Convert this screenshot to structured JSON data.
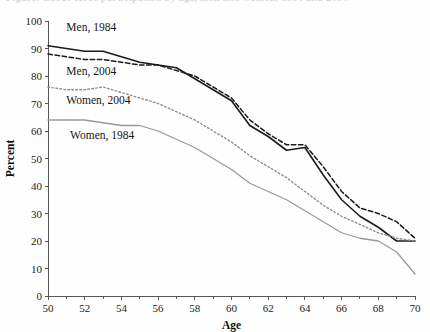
{
  "figure": {
    "cropped_title_fragment": "Figure: Labor force participation by age, men and women, 1984 and 2004",
    "background_color": "#fefefe"
  },
  "chart_data": {
    "type": "line",
    "title": "",
    "xlabel": "Age",
    "ylabel": "Percent",
    "xlim": [
      50,
      70
    ],
    "ylim": [
      0,
      100
    ],
    "xticks": [
      50,
      52,
      54,
      56,
      58,
      60,
      62,
      64,
      66,
      68,
      70
    ],
    "xtick_labels": [
      "50",
      "52",
      "54",
      "56",
      "58",
      "60",
      "62",
      "64",
      "66",
      "68",
      "70"
    ],
    "xminor_ticks": [
      51,
      53,
      55,
      57,
      59,
      61,
      63,
      65,
      67,
      69
    ],
    "yticks": [
      0,
      10,
      20,
      30,
      40,
      50,
      60,
      70,
      80,
      90,
      100
    ],
    "ytick_labels": [
      "0",
      "10",
      "20",
      "30",
      "40",
      "50",
      "60",
      "70",
      "80",
      "90",
      "100"
    ],
    "grid": false,
    "legend_position": "inline-labels",
    "x": [
      50,
      51,
      52,
      53,
      54,
      55,
      56,
      57,
      58,
      59,
      60,
      61,
      62,
      63,
      64,
      65,
      66,
      67,
      68,
      69,
      70
    ],
    "series": [
      {
        "name": "Men, 1984",
        "color": "#1b1b1b",
        "style": "solid",
        "width": 1.6,
        "label_x": 51.0,
        "label_y": 96.5,
        "values": [
          91,
          90,
          89,
          89,
          87,
          85,
          84,
          83,
          79,
          75,
          71,
          62,
          58,
          53,
          54,
          44,
          35,
          29,
          25,
          20,
          20
        ]
      },
      {
        "name": "Men, 2004",
        "color": "#1b1b1b",
        "style": "dashed",
        "width": 1.5,
        "label_x": 51.0,
        "label_y": 80.5,
        "values": [
          88,
          87,
          86,
          86,
          85,
          84,
          84,
          82,
          80,
          76,
          72,
          64,
          59,
          55,
          55,
          47,
          38,
          32,
          30,
          27,
          21
        ]
      },
      {
        "name": "Women, 2004",
        "color": "#8d8d8d",
        "style": "dotted",
        "width": 1.4,
        "label_x": 51.0,
        "label_y": 70.0,
        "values": [
          76,
          75,
          75,
          76,
          74,
          72,
          70,
          67,
          64,
          60,
          56,
          51,
          47,
          43,
          38,
          33,
          29,
          26,
          23,
          21,
          20
        ]
      },
      {
        "name": "Women, 1984",
        "color": "#9a9a9a",
        "style": "solid",
        "width": 1.3,
        "label_x": 51.2,
        "label_y": 57.0,
        "values": [
          64,
          64,
          64,
          63,
          62,
          62,
          60,
          57,
          54,
          50,
          46,
          41,
          38,
          35,
          31,
          27,
          23,
          21,
          20,
          16,
          8
        ]
      }
    ]
  }
}
